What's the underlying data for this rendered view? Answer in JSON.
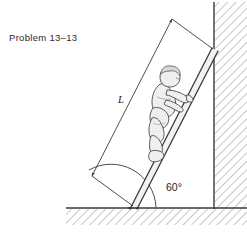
{
  "figure": {
    "problem_label": "Problem 13–13",
    "length_label": "L",
    "angle_label": "60°",
    "colors": {
      "ink": "#2b2b2b",
      "line": "#3a3a3a",
      "hatch": "#8a8a8a",
      "figure_fill": "#f2f0ee",
      "background": "#ffffff"
    },
    "scene": {
      "description": "Ladder leaning against a vertical wall with a person climbing it",
      "ladder": {
        "base_point": [
          133,
          207
        ],
        "top_point": [
          213,
          50
        ],
        "angle_with_ground_degrees": 60,
        "rail_count": 2
      },
      "wall": {
        "type": "vertical",
        "x": 214,
        "hatched_side": "right"
      },
      "ground": {
        "type": "horizontal",
        "y": 208,
        "hatched_side": "below"
      },
      "dimension_line": {
        "label": "L",
        "measures": "ladder length",
        "arrow_ends": "both",
        "start_point": [
          68,
          168
        ],
        "end_point": [
          168,
          22
        ]
      },
      "angle_arc": {
        "label": "60°",
        "vertex": [
          133,
          207
        ],
        "between": [
          "ground",
          "ladder"
        ]
      },
      "person": {
        "pose": "climbing",
        "facing": "up-right"
      }
    }
  }
}
